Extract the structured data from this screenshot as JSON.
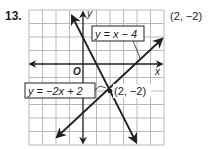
{
  "problem_number": "13.",
  "answer": "(2, −2)",
  "graph": {
    "x_axis_label": "x",
    "y_axis_label": "y",
    "origin_label": "O",
    "grid": {
      "x_min": -4,
      "x_max": 6,
      "y_min": -6,
      "y_max": 4,
      "step": 1
    },
    "lines": [
      {
        "equation": "y = x − 4",
        "slope": 1,
        "intercept": -4
      },
      {
        "equation": "y = −2x + 2",
        "slope": -2,
        "intercept": 2
      }
    ],
    "intersection": {
      "label": "(2, −2)",
      "x": 2,
      "y": -2
    }
  },
  "colors": {
    "ink": "#231f20",
    "grid": "#b9b9b9"
  }
}
